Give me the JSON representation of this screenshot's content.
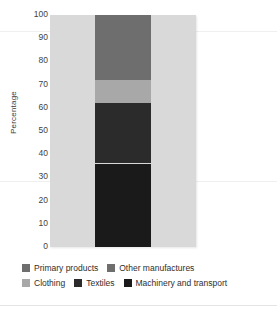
{
  "chart_data": {
    "type": "bar",
    "title": "",
    "subtitle": "",
    "xlabel": "",
    "ylabel": "Percentage",
    "ylim": [
      0,
      100
    ],
    "grid": false,
    "stacked": true,
    "orientation": "vertical",
    "legend_position": "bottom",
    "categories": [
      ""
    ],
    "yticks": [
      "100",
      "90",
      "80",
      "70",
      "60",
      "50",
      "40",
      "30",
      "20",
      "10",
      "0"
    ],
    "series": [
      {
        "name": "Primary products",
        "values": [
          0
        ],
        "color": "#6e6e6e",
        "start": 100,
        "end": 100
      },
      {
        "name": "Other manufactures",
        "values": [
          28
        ],
        "color": "#6e6e6e",
        "start": 72,
        "end": 100
      },
      {
        "name": "Clothing",
        "values": [
          10
        ],
        "color": "#a8a8a8",
        "start": 62,
        "end": 72
      },
      {
        "name": "Textiles",
        "values": [
          26
        ],
        "color": "#2b2b2b",
        "start": 36,
        "end": 62
      },
      {
        "name": "Machinery and transport",
        "values": [
          36
        ],
        "color": "#1a1a1a",
        "start": 0,
        "end": 36
      }
    ],
    "plot_background": "#d9d9d9"
  },
  "legend": {
    "rows": [
      [
        {
          "label": "Primary products",
          "color": "#6e6e6e"
        },
        {
          "label": "Other manufactures",
          "color": "#6e6e6e"
        }
      ],
      [
        {
          "label": "Clothing",
          "color": "#a8a8a8"
        },
        {
          "label": "Textiles",
          "color": "#2b2b2b"
        },
        {
          "label": "Machinery and transport",
          "color": "#1a1a1a"
        }
      ]
    ]
  }
}
